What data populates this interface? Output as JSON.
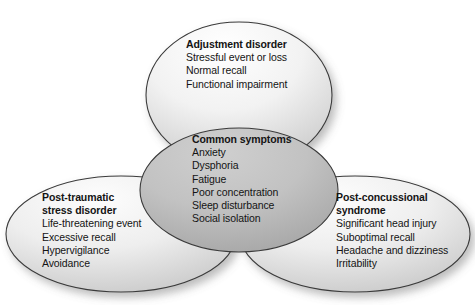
{
  "diagram": {
    "type": "venn",
    "background_color": "#ffffff",
    "stroke_color": "#3a3a3a",
    "outer_fill_light": "#fdfdfd",
    "outer_fill_dark": "#c9c9c9",
    "center_fill_light": "#c6c6c6",
    "center_fill_dark": "#a2a2a2",
    "text_color": "#141414",
    "groups": [
      {
        "id": "adjustment-disorder",
        "position": "top",
        "title": "Adjustment disorder",
        "title_lines": [
          "Adjustment disorder"
        ],
        "items": [
          "Stressful event or loss",
          "Normal recall",
          "Functional impairment"
        ]
      },
      {
        "id": "common-symptoms",
        "position": "center",
        "title": "Common symptoms",
        "title_lines": [
          "Common symptoms"
        ],
        "items": [
          "Anxiety",
          "Dysphoria",
          "Fatigue",
          "Poor concentration",
          "Sleep disturbance",
          "Social isolation"
        ]
      },
      {
        "id": "post-traumatic-stress-disorder",
        "position": "bottom-left",
        "title": "Post-traumatic stress disorder",
        "title_lines": [
          "Post-traumatic",
          "stress disorder"
        ],
        "items": [
          "Life-threatening event",
          "Excessive recall",
          "Hypervigilance",
          "Avoidance"
        ]
      },
      {
        "id": "post-concussional-syndrome",
        "position": "bottom-right",
        "title": "Post-concussional syndrome",
        "title_lines": [
          "Post-concussional",
          "syndrome"
        ],
        "items": [
          "Significant head injury",
          "Suboptimal recall",
          "Headache and dizziness",
          "Irritability"
        ]
      }
    ]
  }
}
